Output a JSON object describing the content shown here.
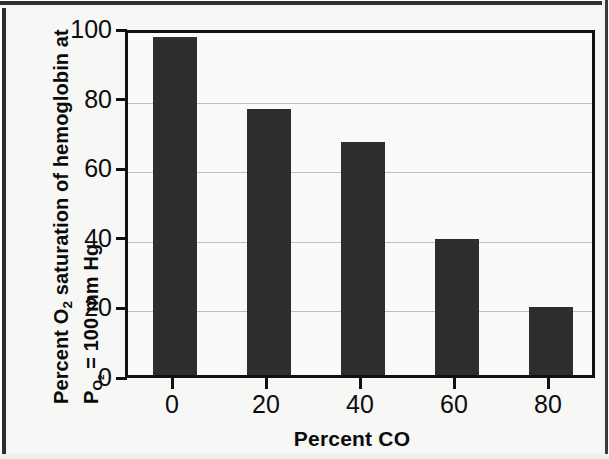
{
  "chart_data": {
    "type": "bar",
    "title": "",
    "xlabel": "Percent CO",
    "ylabel_line1": "Percent O2 saturation of hemoglobin at",
    "ylabel_line2": "PO2 = 100 mm Hg",
    "categories": [
      "0",
      "20",
      "40",
      "60",
      "80"
    ],
    "values": [
      97,
      76.5,
      67,
      39,
      19.5
    ],
    "xlim": [
      -10,
      90
    ],
    "ylim": [
      0,
      100
    ],
    "xticks": [
      "0",
      "20",
      "40",
      "60",
      "80"
    ],
    "yticks": [
      "0",
      "20",
      "40",
      "60",
      "80",
      "100"
    ],
    "grid": "horizontal",
    "legend": "none",
    "bar_color": "#2e2e2e",
    "axis_color": "#111111",
    "gridline_color": "#bfbfbf",
    "background_color": "#fafaf8"
  },
  "axis": {
    "ylabel_parts": {
      "l1_a": "Percent O",
      "l1_sub": "2",
      "l1_b": " saturation of hemoglobin at",
      "l2_p": "P",
      "l2_sub": "O2",
      "l2_b": " = 100 mm Hg"
    }
  }
}
